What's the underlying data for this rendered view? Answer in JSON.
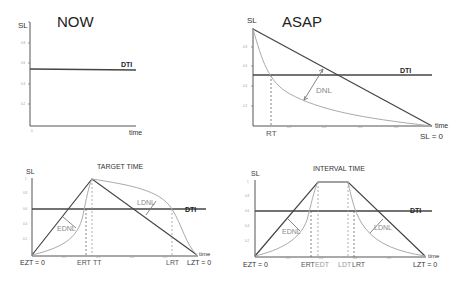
{
  "panels": {
    "now": {
      "title": "NOW",
      "y_axis_label": "SL",
      "x_axis_label": "time",
      "line_label": "DTI",
      "y_ticks": [
        "1",
        "0.8",
        "0.6",
        "0.4",
        "0.2",
        "0"
      ],
      "x_ticks": [
        "0"
      ]
    },
    "asap": {
      "title": "ASAP",
      "y_axis_label": "SL",
      "x_axis_label": "time",
      "line_label": "DTI",
      "curve_label": "DNL",
      "marker_label": "RT",
      "end_label": "SL = 0",
      "y_ticks": [
        "1",
        "0.8",
        "0.6",
        "0.4",
        "0.2",
        "0"
      ],
      "x_ticks": [
        "0.2",
        "0.4",
        "0.6",
        "0.8"
      ]
    },
    "target": {
      "title": "TARGET TIME",
      "y_axis_label": "SL",
      "x_axis_label": "time",
      "line_label": "DTI",
      "early_label": "EDNL",
      "late_label": "LDNL",
      "start_label": "EZT = 0",
      "end_label": "LZT = 0",
      "markers": [
        "ERT",
        "TT",
        "LRT"
      ],
      "y_ticks": [
        "1",
        "0.8",
        "0.6",
        "0.4",
        "0.2"
      ],
      "x_ticks": [
        "0.2",
        "0.4",
        "0.6",
        "0.8"
      ]
    },
    "interval": {
      "title": "INTERVAL TIME",
      "y_axis_label": "SL",
      "x_axis_label": "time",
      "line_label": "DTI",
      "early_label": "EDNL",
      "late_label": "LDNL",
      "start_label": "EZT = 0",
      "end_label": "LZT = 0",
      "markers": [
        "ERT",
        "EDT",
        "LDT",
        "LRT"
      ],
      "y_ticks": [
        "1",
        "0.8",
        "0.6",
        "0.4",
        "0.2",
        "0"
      ],
      "x_ticks": [
        "0.2",
        "0.4",
        "0.6",
        "0.8"
      ]
    }
  },
  "colors": {
    "axis": "#555555",
    "dti": "#444444",
    "curve": "#aaaaaa",
    "text": "#222222"
  }
}
